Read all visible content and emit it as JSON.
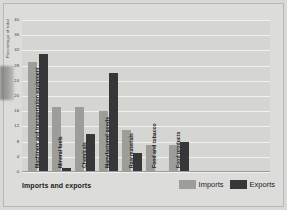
{
  "chart_data": {
    "type": "bar",
    "title": "Imports and exports",
    "xlabel": "",
    "ylabel": "Percentage of total",
    "ylim": [
      0,
      40
    ],
    "yticks": [
      0,
      4,
      8,
      12,
      16,
      20,
      24,
      28,
      32,
      36,
      40
    ],
    "grid": true,
    "legend_position": "bottom-right",
    "categories": [
      "Machinery and transportation equipment",
      "Mineral fuels",
      "Chemicals",
      "Manufactured goods",
      "Raw materials",
      "Food and tobacco",
      "Food products"
    ],
    "series": [
      {
        "name": "Imports",
        "color": "#9d9d9a",
        "values": [
          29,
          17,
          17,
          16,
          11,
          7,
          7
        ]
      },
      {
        "name": "Exports",
        "color": "#37373a",
        "values": [
          31,
          1,
          10,
          26,
          5,
          0,
          8
        ]
      }
    ]
  },
  "legend": {
    "items": [
      {
        "label": "Imports",
        "swatch": "imports-swatch"
      },
      {
        "label": "Exports",
        "swatch": "exports-swatch"
      }
    ]
  },
  "footer": {
    "title": "Imports and exports"
  }
}
